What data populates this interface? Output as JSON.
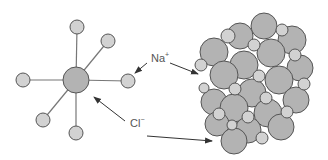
{
  "diagram": {
    "labels": {
      "sodium": {
        "text": "Na",
        "charge": "+"
      },
      "chloride": {
        "text": "Cl",
        "charge": "−"
      }
    },
    "colors": {
      "large_ion": "#b3b3b3",
      "small_ion": "#d2d2d2",
      "stroke": "#555555",
      "bond": "#777777",
      "arrow": "#333333"
    },
    "left_panel": {
      "description": "Octahedral coordination: central Cl- ion bonded to six Na+ ions",
      "center_ion": "Cl-",
      "neighbor_count": 6
    },
    "right_panel": {
      "description": "Close-packed lattice of large Cl- and small Na+ spheres"
    }
  }
}
